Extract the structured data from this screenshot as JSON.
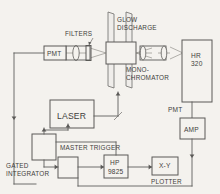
{
  "diagram": {
    "colors": {
      "background": "#f4f2ee",
      "line": "#5a5957",
      "text": "#3f3e3c"
    },
    "labels": {
      "filters": "FILTERS",
      "glow_discharge_line1": "GLOW",
      "glow_discharge_line2": "DISCHARGE",
      "monochromator_line1": "MONO-",
      "monochromator_line2": "CHROMATOR",
      "pmt_left": "PMT",
      "pmt_right": "PMT",
      "hr320_line1": "HR",
      "hr320_line2": "320",
      "amp": "AMP",
      "laser": "LASER",
      "master_trigger": "MASTER TRIGGER",
      "gated_integrator_line1": "GATED",
      "gated_integrator_line2": "INTEGRATOR",
      "hp_line1": "HP",
      "hp_line2": "9825",
      "xy": "X-Y",
      "plotter": "PLOTTER"
    }
  }
}
